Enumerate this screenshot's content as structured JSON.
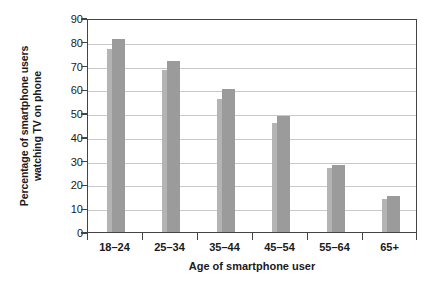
{
  "artifact": {
    "clipped_top_text": "· · ·"
  },
  "chart_data": {
    "type": "bar",
    "title": "",
    "subtitle": "",
    "xlabel": "Age of smartphone user",
    "ylabel": "Percentage of smartphone users watching TV on phone",
    "ylabel_line1": "Percentage of smartphone users",
    "ylabel_line2": "watching TV on phone",
    "categories": [
      "18–24",
      "25–34",
      "35–44",
      "45–54",
      "55–64",
      "65+"
    ],
    "values": [
      81,
      72,
      60,
      49,
      28,
      15
    ],
    "side_values": [
      77,
      68,
      56,
      46,
      27,
      14
    ],
    "ylim": [
      0,
      90
    ],
    "ytick_values": [
      0,
      10,
      20,
      30,
      40,
      50,
      60,
      70,
      80,
      90
    ],
    "ytick_labels": [
      "0",
      "10",
      "20",
      "30",
      "40",
      "50",
      "60",
      "70",
      "80",
      "90"
    ],
    "grid": true,
    "grid_axis": "y",
    "legend": false,
    "legend_position": "none",
    "bar_color": "#9b9b9b",
    "bar_side_color": "#b4b4b4",
    "grid_color": "#c8c8c8",
    "axis_color": "#444444",
    "background_color": "#ffffff"
  }
}
